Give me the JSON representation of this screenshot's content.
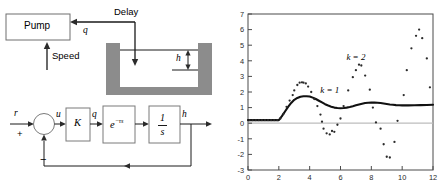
{
  "figure": {
    "left_diagram": {
      "title": "pump-tank-delay-schematic",
      "pump_box_label": "Pump",
      "speed_label": "Speed",
      "delay_label": "Delay",
      "flow_label": "q",
      "level_label": "h"
    },
    "block_diagram": {
      "title": "feedback-control-block-diagram",
      "reference_label": "r",
      "plus_sign": "+",
      "minus_sign": "−",
      "error_label": "u",
      "gain_block_label": "K",
      "flow_label": "q",
      "delay_block_base": "e",
      "delay_block_exponent": "−τs",
      "integrator_numerator": "1",
      "integrator_denominator": "s",
      "output_label": "h"
    }
  },
  "chart_data": {
    "type": "line",
    "title": "",
    "xlabel": "",
    "ylabel": "",
    "xlim": [
      0,
      12
    ],
    "ylim": [
      -3,
      7
    ],
    "grid": false,
    "legend_position": "inline-annotation",
    "x_ticks": [
      0,
      2,
      4,
      6,
      8,
      10,
      12
    ],
    "y_ticks": [
      -3,
      -2,
      -1,
      0,
      1,
      2,
      3,
      4,
      5,
      6,
      7
    ],
    "annotations": [
      {
        "text": "k = 2",
        "x": 7.0,
        "y": 4.05
      },
      {
        "text": "k = 1",
        "x": 5.3,
        "y": 1.95
      }
    ],
    "series": [
      {
        "name": "k = 1",
        "render": "line",
        "x": [
          0.0,
          0.2,
          0.4,
          0.6,
          0.8,
          1.0,
          1.2,
          1.4,
          1.6,
          1.8,
          2.0,
          2.2,
          2.4,
          2.6,
          2.8,
          3.0,
          3.2,
          3.4,
          3.6,
          3.8,
          4.0,
          4.2,
          4.4,
          4.6,
          4.8,
          5.0,
          5.2,
          5.4,
          5.6,
          5.8,
          6.0,
          6.2,
          6.4,
          6.6,
          6.8,
          7.0,
          7.2,
          7.4,
          7.6,
          7.8,
          8.0,
          8.2,
          8.4,
          8.6,
          8.8,
          9.0,
          9.2,
          9.4,
          9.6,
          9.8,
          10.0,
          10.4,
          10.8,
          11.2,
          11.6,
          12.0
        ],
        "y": [
          0.2,
          0.2,
          0.2,
          0.2,
          0.2,
          0.2,
          0.2,
          0.2,
          0.2,
          0.2,
          0.2,
          0.45,
          0.75,
          1.05,
          1.3,
          1.5,
          1.62,
          1.7,
          1.73,
          1.73,
          1.71,
          1.64,
          1.55,
          1.44,
          1.33,
          1.22,
          1.13,
          1.06,
          1.0,
          0.97,
          0.96,
          0.97,
          1.0,
          1.04,
          1.09,
          1.15,
          1.2,
          1.25,
          1.29,
          1.31,
          1.32,
          1.32,
          1.31,
          1.29,
          1.26,
          1.23,
          1.2,
          1.18,
          1.16,
          1.15,
          1.14,
          1.14,
          1.15,
          1.16,
          1.17,
          1.18
        ]
      },
      {
        "name": "k = 2",
        "render": "scatter",
        "x": [
          0.1,
          0.3,
          0.5,
          0.7,
          0.9,
          1.1,
          1.3,
          1.5,
          1.7,
          1.9,
          2.1,
          2.3,
          2.5,
          2.7,
          2.9,
          3.0,
          3.2,
          3.35,
          3.5,
          3.6,
          3.75,
          3.9,
          4.1,
          4.3,
          4.5,
          4.7,
          4.8,
          4.9,
          5.1,
          5.3,
          5.45,
          5.6,
          5.8,
          6.0,
          6.2,
          6.5,
          6.8,
          7.0,
          7.2,
          7.35,
          7.6,
          7.9,
          8.1,
          8.3,
          8.6,
          8.8,
          9.0,
          9.2,
          9.5,
          9.7,
          10.1,
          10.3,
          10.6,
          10.9,
          11.1,
          11.3,
          11.6,
          11.8
        ],
        "y": [
          0.2,
          0.2,
          0.2,
          0.2,
          0.2,
          0.2,
          0.2,
          0.2,
          0.2,
          0.2,
          0.3,
          0.6,
          1.05,
          1.45,
          1.8,
          2.1,
          2.45,
          2.6,
          2.62,
          2.6,
          2.55,
          2.35,
          2.0,
          1.55,
          1.1,
          0.55,
          0.1,
          -0.35,
          -0.65,
          -0.72,
          -0.5,
          -0.55,
          -0.1,
          0.3,
          1.1,
          2.1,
          2.95,
          3.4,
          3.75,
          3.7,
          3.05,
          2.15,
          1.0,
          0.05,
          -0.35,
          -1.35,
          -2.15,
          -2.2,
          -1.2,
          0.15,
          1.8,
          3.4,
          4.8,
          5.6,
          6.0,
          5.45,
          4.15,
          2.3
        ]
      }
    ]
  }
}
